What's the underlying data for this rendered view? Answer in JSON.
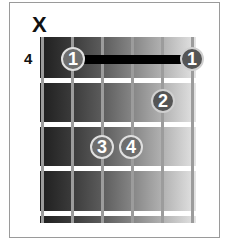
{
  "chord_diagram": {
    "muted_marker": "X",
    "muted_string": 6,
    "start_fret_label": "4",
    "strings": 6,
    "frets_shown": 4,
    "barre": {
      "finger": "1",
      "fret": 1,
      "from_string": 5,
      "to_string": 1
    },
    "fingers": [
      {
        "label": "1",
        "string": 5,
        "fret": 1
      },
      {
        "label": "1",
        "string": 1,
        "fret": 1
      },
      {
        "label": "2",
        "string": 2,
        "fret": 2
      },
      {
        "label": "3",
        "string": 4,
        "fret": 3
      },
      {
        "label": "4",
        "string": 3,
        "fret": 3
      }
    ],
    "colors": {
      "fingerboard_dark": "#1e1e1e",
      "fingerboard_light": "#e4e4e4",
      "fret": "#ffffff",
      "string": "#9c9c9c",
      "finger": "#6e6e6e",
      "barre": "#000000"
    }
  }
}
